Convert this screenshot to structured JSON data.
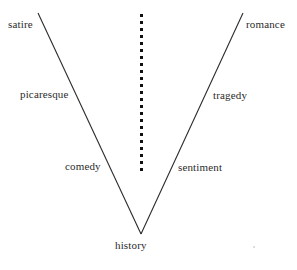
{
  "diagram": {
    "type": "v-shaped-spectrum-diagram",
    "background_color": "#ffffff",
    "stroke_color": "#2b2b2b",
    "text_color": "#2b2b2b",
    "apex_label": "history",
    "center_axis": {
      "name": "dotted-vertical-axis",
      "style": "dotted",
      "x": 141,
      "y_top": 14,
      "y_bottom": 173,
      "dot_size": 3,
      "dot_gap": 4
    },
    "left_arm": {
      "name": "left-diagonal-line",
      "x1": 38,
      "y1": 13,
      "x2": 141,
      "y2": 234,
      "labels": [
        "satire",
        "picaresque",
        "comedy"
      ]
    },
    "right_arm": {
      "name": "right-diagonal-line",
      "x1": 243,
      "y1": 13,
      "x2": 141,
      "y2": 234,
      "labels": [
        "romance",
        "tragedy",
        "sentiment"
      ]
    },
    "labels": {
      "satire": "satire",
      "romance": "romance",
      "picaresque": "picaresque",
      "tragedy": "tragedy",
      "comedy": "comedy",
      "sentiment": "sentiment",
      "history": "history"
    }
  }
}
